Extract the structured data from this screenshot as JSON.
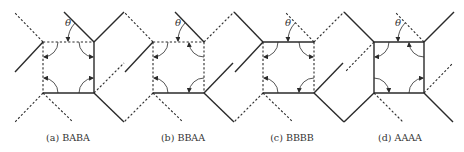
{
  "figure": {
    "colors": {
      "line": "#2a2a2a",
      "text": "#333333",
      "background": "#ffffff"
    },
    "angle_label": "θ",
    "panels": [
      {
        "id": "a",
        "caption": "(a) BABA",
        "square": {
          "x": 43,
          "y": 42,
          "size": 51
        },
        "edges": {
          "top": "dashed",
          "right": "solid",
          "bottom": "solid",
          "left": "dashed"
        },
        "legs": [
          {
            "x1": 43,
            "y1": 42,
            "x2": 14,
            "y2": 12,
            "style": "dashed"
          },
          {
            "x1": 43,
            "y1": 42,
            "x2": 15,
            "y2": 72,
            "style": "solid"
          },
          {
            "x1": 94,
            "y1": 42,
            "x2": 64,
            "y2": 12,
            "style": "solid"
          },
          {
            "x1": 94,
            "y1": 42,
            "x2": 124,
            "y2": 12,
            "style": "solid"
          },
          {
            "x1": 94,
            "y1": 93,
            "x2": 124,
            "y2": 63,
            "style": "dashed"
          },
          {
            "x1": 94,
            "y1": 93,
            "x2": 124,
            "y2": 122,
            "style": "solid"
          },
          {
            "x1": 43,
            "y1": 93,
            "x2": 15,
            "y2": 122,
            "style": "dashed"
          },
          {
            "x1": 43,
            "y1": 93,
            "x2": 73,
            "y2": 122,
            "style": "dashed"
          }
        ],
        "arrows": {
          "tl": "left",
          "tr": "right",
          "br": "right",
          "bl": "left"
        },
        "caption_x": 68
      },
      {
        "id": "b",
        "caption": "(b) BBAA",
        "square": {
          "x": 153,
          "y": 42,
          "size": 51
        },
        "edges": {
          "top": "dashed",
          "right": "dashed",
          "bottom": "solid",
          "left": "dashed"
        },
        "legs": [
          {
            "x1": 153,
            "y1": 42,
            "x2": 124,
            "y2": 12,
            "style": "dashed"
          },
          {
            "x1": 153,
            "y1": 42,
            "x2": 125,
            "y2": 72,
            "style": "solid"
          },
          {
            "x1": 204,
            "y1": 42,
            "x2": 175,
            "y2": 12,
            "style": "solid"
          },
          {
            "x1": 204,
            "y1": 42,
            "x2": 234,
            "y2": 12,
            "style": "dashed"
          },
          {
            "x1": 204,
            "y1": 93,
            "x2": 233,
            "y2": 63,
            "style": "solid"
          },
          {
            "x1": 204,
            "y1": 93,
            "x2": 234,
            "y2": 122,
            "style": "solid"
          },
          {
            "x1": 153,
            "y1": 93,
            "x2": 124,
            "y2": 122,
            "style": "dashed"
          },
          {
            "x1": 153,
            "y1": 93,
            "x2": 183,
            "y2": 122,
            "style": "dashed"
          }
        ],
        "arrows": {
          "tl": "left",
          "tr": "top",
          "br": "bottom",
          "bl": "left"
        },
        "caption_x": 183
      },
      {
        "id": "c",
        "caption": "(c) BBBB",
        "square": {
          "x": 263,
          "y": 42,
          "size": 51
        },
        "edges": {
          "top": "solid",
          "right": "dashed",
          "bottom": "solid",
          "left": "dashed"
        },
        "legs": [
          {
            "x1": 263,
            "y1": 42,
            "x2": 234,
            "y2": 12,
            "style": "solid"
          },
          {
            "x1": 263,
            "y1": 42,
            "x2": 235,
            "y2": 72,
            "style": "solid"
          },
          {
            "x1": 314,
            "y1": 42,
            "x2": 285,
            "y2": 12,
            "style": "dashed"
          },
          {
            "x1": 314,
            "y1": 42,
            "x2": 344,
            "y2": 12,
            "style": "dashed"
          },
          {
            "x1": 314,
            "y1": 93,
            "x2": 343,
            "y2": 63,
            "style": "solid"
          },
          {
            "x1": 314,
            "y1": 93,
            "x2": 344,
            "y2": 122,
            "style": "solid"
          },
          {
            "x1": 263,
            "y1": 93,
            "x2": 234,
            "y2": 122,
            "style": "dashed"
          },
          {
            "x1": 263,
            "y1": 93,
            "x2": 293,
            "y2": 122,
            "style": "dashed"
          }
        ],
        "arrows": {
          "tl": "left",
          "tr": "right",
          "br": "bottom",
          "bl": "left"
        },
        "caption_x": 292
      },
      {
        "id": "d",
        "caption": "(d) AAAA",
        "square": {
          "x": 374,
          "y": 42,
          "size": 50
        },
        "edges": {
          "top": "solid",
          "right": "solid",
          "bottom": "solid",
          "left": "solid"
        },
        "legs": [
          {
            "x1": 374,
            "y1": 42,
            "x2": 344,
            "y2": 12,
            "style": "solid"
          },
          {
            "x1": 374,
            "y1": 42,
            "x2": 345,
            "y2": 72,
            "style": "dashed"
          },
          {
            "x1": 424,
            "y1": 42,
            "x2": 395,
            "y2": 12,
            "style": "dashed"
          },
          {
            "x1": 424,
            "y1": 42,
            "x2": 454,
            "y2": 12,
            "style": "solid"
          },
          {
            "x1": 424,
            "y1": 93,
            "x2": 453,
            "y2": 63,
            "style": "dashed"
          },
          {
            "x1": 424,
            "y1": 93,
            "x2": 453,
            "y2": 122,
            "style": "solid"
          },
          {
            "x1": 374,
            "y1": 93,
            "x2": 344,
            "y2": 122,
            "style": "solid"
          },
          {
            "x1": 374,
            "y1": 93,
            "x2": 403,
            "y2": 122,
            "style": "dashed"
          }
        ],
        "arrows": {
          "tl": "left",
          "tr": "top",
          "br": "right",
          "bl": "bottom"
        },
        "caption_x": 400
      }
    ],
    "caption_y": 141
  }
}
